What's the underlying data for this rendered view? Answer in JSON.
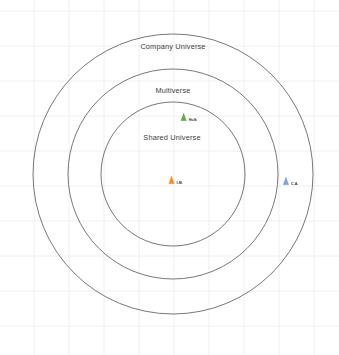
{
  "canvas": {
    "width": 339,
    "height": 355,
    "background": "#ffffff",
    "grid_color": "#f0f0f0",
    "grid_spacing": 35
  },
  "chart_data": {
    "type": "diagram",
    "subtype": "concentric-circles-scatter",
    "title": "",
    "xlabel": "",
    "ylabel": "",
    "grid": true,
    "legend": "none",
    "center": {
      "x": 173,
      "y": 174
    },
    "rings": [
      {
        "id": "company-universe",
        "label": "Company Universe",
        "radius": 140,
        "stroke": "#555555",
        "stroke_width": 0.8,
        "label_x": 173,
        "label_y": 46
      },
      {
        "id": "multiverse",
        "label": "Multiverse",
        "radius": 105,
        "stroke": "#555555",
        "stroke_width": 0.8,
        "label_x": 173,
        "label_y": 90
      },
      {
        "id": "shared-universe",
        "label": "Shared Universe",
        "radius": 72,
        "stroke": "#555555",
        "stroke_width": 0.8,
        "label_x": 172,
        "label_y": 137
      }
    ],
    "points": [
      {
        "id": "hulk",
        "label": "Hulk",
        "x": 188,
        "y": 117,
        "color": "#6aa84f",
        "marker": "triangle",
        "size": 9
      },
      {
        "id": "iron-man",
        "label": "I.M.",
        "x": 175,
        "y": 180,
        "color": "#f28e2b",
        "marker": "triangle",
        "size": 9
      },
      {
        "id": "captain-america",
        "label": "C.A.",
        "x": 290,
        "y": 181,
        "color": "#76a5d8",
        "marker": "triangle",
        "size": 9
      }
    ]
  }
}
